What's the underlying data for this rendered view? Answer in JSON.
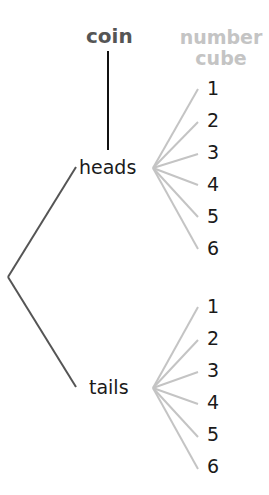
{
  "headers": {
    "stage1": "coin",
    "stage2_line1": "number",
    "stage2_line2": "cube"
  },
  "colors": {
    "stage1_header": "#555555",
    "stage2_header": "#c4c4c4",
    "stage1_branches": "#555555",
    "stage2_branches": "#c4c4c4",
    "connector": "#111111",
    "labels": "#1a1a1a"
  },
  "tree": {
    "root": "",
    "branches": [
      {
        "label": "heads",
        "children": [
          "1",
          "2",
          "3",
          "4",
          "5",
          "6"
        ]
      },
      {
        "label": "tails",
        "children": [
          "1",
          "2",
          "3",
          "4",
          "5",
          "6"
        ]
      }
    ]
  }
}
